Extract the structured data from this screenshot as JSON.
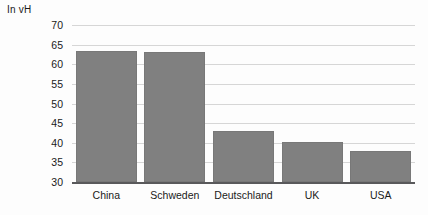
{
  "chart_data": {
    "type": "bar",
    "title": "",
    "subtitle": "",
    "xlabel": "",
    "ylabel": "In vH",
    "ylim": [
      30,
      70
    ],
    "ytick_step": 5,
    "yticks": [
      70,
      65,
      60,
      55,
      50,
      45,
      40,
      35,
      30
    ],
    "grid": true,
    "legend": false,
    "legend_position": "none",
    "categories": [
      "China",
      "Schweden",
      "Deutschland",
      "UK",
      "USA"
    ],
    "values": [
      63.5,
      63,
      43,
      40.3,
      37.8
    ],
    "bar_color": "#808080",
    "grid_color": "#d6d6d6",
    "axis_color": "#59595b",
    "background": "#fdfdfd"
  }
}
